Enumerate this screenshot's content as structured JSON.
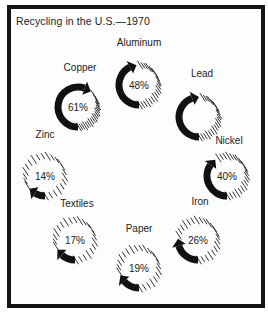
{
  "chart_data": {
    "type": "pie",
    "subtype": "circular-arrow-gauges",
    "title": "Recycling in the U.S.—1970",
    "xlabel": "",
    "ylabel": "",
    "unit": "%",
    "categories": [
      "Aluminum",
      "Lead",
      "Nickel",
      "Iron",
      "Paper",
      "Textiles",
      "Zinc",
      "Copper"
    ],
    "values": [
      48,
      50,
      40,
      26,
      19,
      17,
      14,
      61
    ],
    "value_labels": [
      "48%",
      "",
      "40%",
      "26%",
      "19%",
      "17%",
      "14%",
      "61%"
    ],
    "items": [
      {
        "name": "Aluminum",
        "value": 48,
        "label": "48%",
        "cx": 139,
        "cy": 85,
        "lx": 139,
        "ly": 46,
        "anchor": "middle"
      },
      {
        "name": "Lead",
        "value": 50,
        "label": "",
        "cx": 199,
        "cy": 117,
        "lx": 202,
        "ly": 77,
        "anchor": "middle"
      },
      {
        "name": "Nickel",
        "value": 40,
        "label": "40%",
        "cx": 227,
        "cy": 176,
        "lx": 229,
        "ly": 144,
        "anchor": "middle"
      },
      {
        "name": "Iron",
        "value": 26,
        "label": "26%",
        "cx": 198,
        "cy": 240,
        "lx": 200,
        "ly": 205,
        "anchor": "middle"
      },
      {
        "name": "Paper",
        "value": 19,
        "label": "19%",
        "cx": 139,
        "cy": 268,
        "lx": 139,
        "ly": 232,
        "anchor": "middle"
      },
      {
        "name": "Textiles",
        "value": 17,
        "label": "17%",
        "cx": 75,
        "cy": 240,
        "lx": 77,
        "ly": 207,
        "anchor": "middle"
      },
      {
        "name": "Zinc",
        "value": 14,
        "label": "14%",
        "cx": 45,
        "cy": 176,
        "lx": 45,
        "ly": 138,
        "anchor": "middle"
      },
      {
        "name": "Copper",
        "value": 61,
        "label": "61%",
        "cx": 78,
        "cy": 107,
        "lx": 80,
        "ly": 71,
        "anchor": "middle"
      }
    ],
    "colors": {
      "arc": "#111111",
      "hatch": "#333333",
      "text": "#222222",
      "frame": "#141414"
    }
  }
}
